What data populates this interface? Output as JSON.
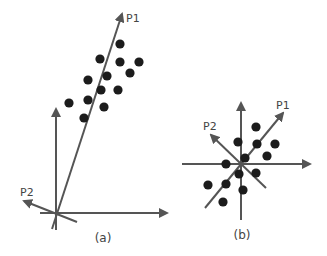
{
  "colors": {
    "line": "#555555",
    "dot": "#1c1c1c",
    "text": "#444444",
    "background": "#ffffff"
  },
  "panels": [
    {
      "id": "a",
      "caption": "(a)",
      "caption_pos": [
        103,
        242
      ],
      "x_axis": {
        "from": [
          40,
          213
        ],
        "to": [
          167,
          213
        ]
      },
      "y_axis": {
        "from": [
          56,
          230
        ],
        "to": [
          56,
          109
        ]
      },
      "p1": {
        "label": "P1",
        "from": [
          52,
          229
        ],
        "to": [
          122,
          14
        ],
        "label_pos": [
          126,
          22
        ]
      },
      "p2": {
        "label": "P2",
        "from": [
          77,
          222
        ],
        "to": [
          24,
          201
        ],
        "label_pos": [
          20,
          196
        ]
      },
      "points": [
        [
          120,
          44
        ],
        [
          100,
          59
        ],
        [
          120,
          62
        ],
        [
          139,
          62
        ],
        [
          107,
          76
        ],
        [
          130,
          73
        ],
        [
          88,
          80
        ],
        [
          101,
          90
        ],
        [
          118,
          90
        ],
        [
          69,
          103
        ],
        [
          88,
          100
        ],
        [
          104,
          107
        ],
        [
          84,
          118
        ]
      ]
    },
    {
      "id": "b",
      "caption": "(b)",
      "caption_pos": [
        242,
        239
      ],
      "x_axis": {
        "from": [
          182,
          164
        ],
        "to": [
          310,
          164
        ]
      },
      "y_axis": {
        "from": [
          241,
          220
        ],
        "to": [
          241,
          103
        ]
      },
      "p1": {
        "label": "P1",
        "from": [
          205,
          208
        ],
        "to": [
          283,
          113
        ],
        "label_pos": [
          276,
          109
        ]
      },
      "p2": {
        "label": "P2",
        "from": [
          266,
          188
        ],
        "to": [
          211,
          135
        ],
        "label_pos": [
          203,
          130
        ]
      },
      "points": [
        [
          256,
          127
        ],
        [
          238,
          142
        ],
        [
          257,
          144
        ],
        [
          275,
          144
        ],
        [
          245,
          158
        ],
        [
          267,
          156
        ],
        [
          226,
          164
        ],
        [
          239,
          174
        ],
        [
          256,
          173
        ],
        [
          208,
          185
        ],
        [
          226,
          184
        ],
        [
          243,
          190
        ],
        [
          223,
          202
        ]
      ]
    }
  ]
}
